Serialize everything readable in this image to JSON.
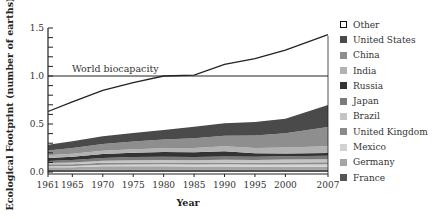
{
  "chart_data": {
    "type": "area",
    "stacked": true,
    "title": "",
    "xlabel": "Year",
    "ylabel": "Ecological Footprint (number of earths)",
    "xlim": [
      1961,
      2007
    ],
    "ylim": [
      0.0,
      1.5
    ],
    "x_ticks": [
      "1961",
      "1965",
      "1970",
      "1975",
      "1980",
      "1985",
      "1990",
      "1995",
      "2000",
      "2007"
    ],
    "y_ticks": [
      "0.0",
      "0.5",
      "1.0",
      "1.5"
    ],
    "grid": false,
    "legend_position": "right",
    "annotations": [
      {
        "text": "World biocapacity",
        "y": 1.0
      }
    ],
    "reference_line": {
      "name": "World biocapacity",
      "value": 1.0
    },
    "x": [
      1961,
      1965,
      1970,
      1975,
      1980,
      1985,
      1990,
      1995,
      2000,
      2007
    ],
    "total_line": {
      "name": "Other (total footprint)",
      "values": [
        0.63,
        0.73,
        0.85,
        0.93,
        1.0,
        1.01,
        1.12,
        1.18,
        1.27,
        1.43
      ]
    },
    "series": [
      {
        "name": "France",
        "color": "#555555",
        "values": [
          0.02,
          0.02,
          0.025,
          0.025,
          0.025,
          0.025,
          0.025,
          0.025,
          0.025,
          0.025
        ]
      },
      {
        "name": "Germany",
        "color": "#a5a5a5",
        "values": [
          0.03,
          0.03,
          0.035,
          0.035,
          0.035,
          0.033,
          0.033,
          0.03,
          0.03,
          0.03
        ]
      },
      {
        "name": "Mexico",
        "color": "#d2d2d2",
        "values": [
          0.01,
          0.012,
          0.015,
          0.018,
          0.02,
          0.02,
          0.022,
          0.022,
          0.024,
          0.026
        ]
      },
      {
        "name": "United Kingdom",
        "color": "#8a8a8a",
        "values": [
          0.02,
          0.02,
          0.022,
          0.022,
          0.02,
          0.02,
          0.02,
          0.02,
          0.02,
          0.02
        ]
      },
      {
        "name": "Brazil",
        "color": "#c4c4c4",
        "values": [
          0.015,
          0.017,
          0.02,
          0.022,
          0.025,
          0.025,
          0.027,
          0.028,
          0.03,
          0.033
        ]
      },
      {
        "name": "Japan",
        "color": "#7a7a7a",
        "values": [
          0.02,
          0.025,
          0.03,
          0.033,
          0.033,
          0.033,
          0.035,
          0.035,
          0.035,
          0.035
        ]
      },
      {
        "name": "Russia",
        "color": "#333333",
        "values": [
          0.03,
          0.035,
          0.04,
          0.045,
          0.05,
          0.05,
          0.055,
          0.035,
          0.03,
          0.03
        ]
      },
      {
        "name": "India",
        "color": "#b2b2b2",
        "values": [
          0.03,
          0.032,
          0.035,
          0.037,
          0.04,
          0.045,
          0.05,
          0.055,
          0.06,
          0.07
        ]
      },
      {
        "name": "China",
        "color": "#8e8e8e",
        "values": [
          0.05,
          0.06,
          0.07,
          0.08,
          0.09,
          0.1,
          0.11,
          0.13,
          0.15,
          0.2
        ]
      },
      {
        "name": "United States",
        "color": "#4a4a4a",
        "values": [
          0.06,
          0.07,
          0.08,
          0.09,
          0.1,
          0.12,
          0.13,
          0.14,
          0.15,
          0.23
        ]
      }
    ]
  },
  "legend": {
    "items": [
      {
        "label": "Other",
        "color": "#ffffff",
        "outline": true
      },
      {
        "label": "United States",
        "color": "#4a4a4a"
      },
      {
        "label": "China",
        "color": "#8e8e8e"
      },
      {
        "label": "India",
        "color": "#b2b2b2"
      },
      {
        "label": "Russia",
        "color": "#333333"
      },
      {
        "label": "Japan",
        "color": "#7a7a7a"
      },
      {
        "label": "Brazil",
        "color": "#c4c4c4"
      },
      {
        "label": "United Kingdom",
        "color": "#8a8a8a"
      },
      {
        "label": "Mexico",
        "color": "#d2d2d2"
      },
      {
        "label": "Germany",
        "color": "#a5a5a5"
      },
      {
        "label": "France",
        "color": "#555555"
      }
    ]
  }
}
